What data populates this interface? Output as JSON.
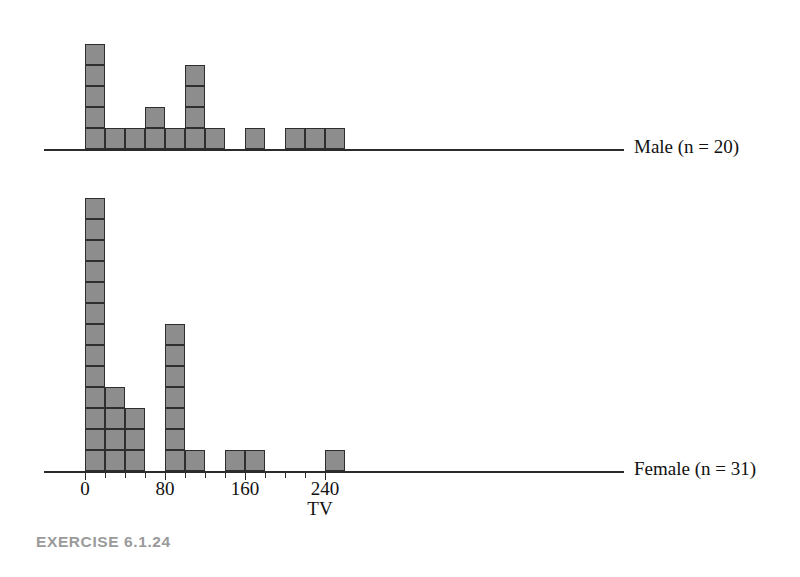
{
  "caption": "EXERCISE 6.1.24",
  "axis_title": "TV",
  "series_labels": {
    "male": "Male (n = 20)",
    "female": "Female (n = 31)"
  },
  "tick_labels": [
    "0",
    "80",
    "160",
    "240"
  ],
  "colors": {
    "cell_fill": "#8d8d8d",
    "cell_stroke": "#2e2e2e",
    "axis": "#2b2b2b",
    "text": "#111111",
    "caption": "#9a9a9a"
  },
  "chart_data": {
    "type": "bar",
    "subtype": "stacked-dotplot-histogram",
    "title": "",
    "xlabel": "TV",
    "ylabel": "",
    "xlim": [
      -10,
      250
    ],
    "bin_width": 20,
    "grid": false,
    "legend": "right-of-plot",
    "tick_values": [
      0,
      80,
      160,
      240
    ],
    "minor_tick_step": 20,
    "panels": [
      {
        "name": "Male",
        "label": "Male (n = 20)",
        "n": 20,
        "bin_starts": [
          0,
          20,
          40,
          60,
          80,
          100,
          120,
          140,
          160,
          180,
          200,
          220,
          240
        ],
        "counts": [
          5,
          1,
          1,
          2,
          1,
          4,
          1,
          0,
          1,
          0,
          1,
          1,
          1
        ],
        "bin_left_edges_used": [
          0,
          20,
          40,
          60,
          80,
          100,
          120,
          160,
          200,
          220
        ]
      },
      {
        "name": "Female",
        "label": "Female (n = 31)",
        "n": 31,
        "bin_starts": [
          0,
          20,
          40,
          60,
          80,
          100,
          120,
          140,
          160,
          180,
          200,
          220,
          240
        ],
        "counts": [
          13,
          4,
          3,
          0,
          7,
          1,
          0,
          1,
          1,
          0,
          0,
          0,
          1
        ],
        "bin_left_edges_used": [
          0,
          20,
          40,
          80,
          100,
          140,
          160,
          240
        ]
      }
    ]
  }
}
